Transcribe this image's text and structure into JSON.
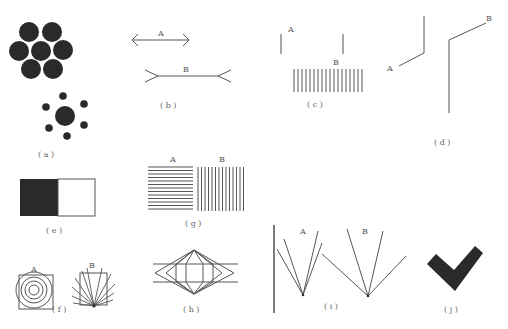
{
  "figure": {
    "panels": [
      {
        "id": "a",
        "caption": "( a )",
        "description": "Ebbinghaus illusion: central circle surrounded by large circles vs small circles"
      },
      {
        "id": "b",
        "caption": "( b )",
        "label_A": "A",
        "label_B": "B",
        "description": "Müller-Lyer illusion"
      },
      {
        "id": "c",
        "caption": "( c )",
        "label_A": "A",
        "label_B": "B",
        "description": "Oppel-Kundt filled vs unfilled space illusion"
      },
      {
        "id": "d",
        "caption": "( d )",
        "label_A": "A",
        "label_B": "B",
        "description": "Vertical lines with oblique extensions"
      },
      {
        "id": "e",
        "caption": "( e )",
        "description": "Irradiation illusion: black and white squares"
      },
      {
        "id": "f",
        "caption": "( f )",
        "label_A": "A",
        "label_B": "B",
        "description": "Squares distorted by concentric circles and radiating lines"
      },
      {
        "id": "g",
        "caption": "( g )",
        "label_A": "A",
        "label_B": "B",
        "description": "Horizontal vs vertical line gratings"
      },
      {
        "id": "h",
        "caption": "( h )",
        "description": "Hering-type illusion: parallel lines crossing fan of angles"
      },
      {
        "id": "i",
        "caption": "( i )",
        "label_A": "A",
        "label_B": "B",
        "description": "Angle/fan lines illusion"
      },
      {
        "id": "j",
        "caption": "( j )",
        "description": "Check mark shape"
      }
    ]
  },
  "colors": {
    "ink": "#555555",
    "fill_dark": "#2a2a2a",
    "background": "#ffffff"
  }
}
